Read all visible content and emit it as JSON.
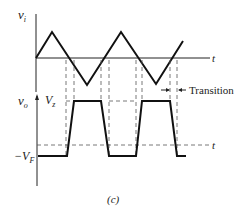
{
  "figure": {
    "caption": "(c)",
    "input_plot": {
      "y_label": "v",
      "y_label_sub": "i",
      "x_label": "t"
    },
    "output_plot": {
      "y_label": "v",
      "y_label_sub": "o",
      "x_label": "t",
      "high_level_label": "V",
      "high_level_sub": "z",
      "low_level_label": "−V",
      "low_level_sub": "F",
      "annotation": "Transition"
    }
  }
}
